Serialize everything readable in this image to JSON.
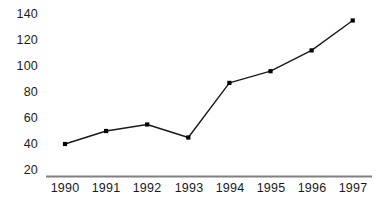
{
  "chart_data": {
    "type": "line",
    "title": "",
    "subtitle": "",
    "xlabel": "",
    "ylabel": "",
    "categories": [
      "1990",
      "1991",
      "1992",
      "1993",
      "1994",
      "1995",
      "1996",
      "1997"
    ],
    "values": [
      40,
      50,
      55,
      45,
      87,
      96,
      112,
      135
    ],
    "series": [
      {
        "name": "",
        "values": [
          40,
          50,
          55,
          45,
          87,
          96,
          112,
          135
        ]
      }
    ],
    "x_tick_labels": [
      "1990",
      "1991",
      "1992",
      "1993",
      "1994",
      "1995",
      "1996",
      "1997"
    ],
    "y_tick_labels": [
      "20",
      "40",
      "60",
      "80",
      "100",
      "120",
      "140"
    ],
    "y_ticks": [
      20,
      40,
      60,
      80,
      100,
      120,
      140
    ],
    "ylim": [
      20,
      140
    ],
    "grid": false,
    "legend": false,
    "legend_position": "none",
    "annotations": [],
    "colors": {
      "line": "#1a1a1a",
      "marker": "#000000",
      "axis": "#808080",
      "text": "#1a1a1a",
      "background": "#ffffff"
    },
    "marker_style": "square",
    "axis_style": {
      "x_axis_visible": true,
      "y_axis_visible": false,
      "x_axis_start_px": 46,
      "x_axis_end_px": 372
    }
  }
}
